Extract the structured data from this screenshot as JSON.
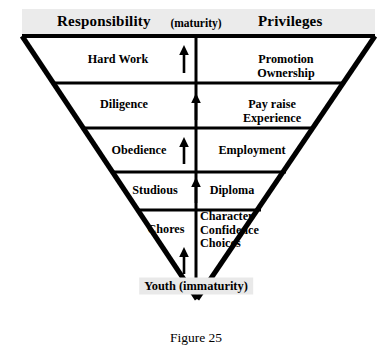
{
  "figure": {
    "caption": "Figure 25",
    "type": "inverted-triangle-hierarchy"
  },
  "header": {
    "left_title": "Responsibility",
    "center_note": "(maturity)",
    "right_title": "Privileges"
  },
  "apex": {
    "label": "Youth (immaturity)"
  },
  "colors": {
    "background": "#ffffff",
    "stroke": "#000000",
    "header_band": "#ebebeb",
    "apex_pill": "#e9e9e9"
  },
  "rows": [
    {
      "responsibility": "Hard Work",
      "privileges": "Promotion\nOwnership",
      "privileges_lines": [
        "Promotion",
        "Ownership"
      ],
      "arrow": "up-arrow"
    },
    {
      "responsibility": "Diligence",
      "privileges": "Pay raise\nExperience",
      "privileges_lines": [
        "Pay raise",
        "Experience"
      ],
      "arrow": "up-arrow"
    },
    {
      "responsibility": "Obedience",
      "privileges": "Employment",
      "privileges_lines": [
        "Employment"
      ],
      "arrow": "up-arrow"
    },
    {
      "responsibility": "Studious",
      "privileges": "Diploma",
      "privileges_lines": [
        "Diploma"
      ],
      "arrow": "up-arrow"
    },
    {
      "responsibility": "Chores",
      "privileges": "Character\nConfidence\nChoices",
      "privileges_lines": [
        "Character",
        "Confidence",
        "Choices"
      ],
      "arrow": "up-arrow"
    }
  ]
}
